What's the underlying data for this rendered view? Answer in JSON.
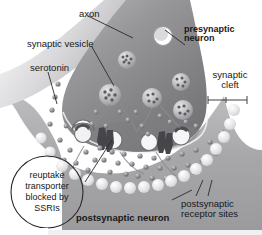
{
  "figure": {
    "background_color": "#ffffff"
  },
  "colors": {
    "presynaptic_fill": "#8e8e91",
    "presynaptic_dark": "#6c6c70",
    "postsynaptic_fill": "#a9a9ad",
    "cleft_fill": "#fdfdfd",
    "receptor_fill": "#e4e4e6",
    "vesicle_fill": "#b9b9bd",
    "serotonin_dot": "#7c7c80",
    "transporter": "#4a4a4e",
    "text": "#17171a",
    "leader_line": "#2a2a2e"
  },
  "labels": {
    "axon": {
      "text": "axon",
      "bold": false
    },
    "presynaptic_neuron": {
      "line1": "presynaptic",
      "line2": "neuron",
      "bold": true
    },
    "synaptic_vesicle": {
      "text": "synaptic vesicle",
      "bold": false
    },
    "serotonin": {
      "text": "serotonin",
      "bold": false
    },
    "synaptic_cleft": {
      "line1": "synaptic",
      "line2": "cleft",
      "bold": false
    },
    "reuptake_callout": {
      "line1": "reuptake",
      "line2": "transporter",
      "line3": "blocked by",
      "line4": "SSRIs",
      "bold": false
    },
    "postsynaptic_neuron": {
      "text": "postsynaptic neuron",
      "bold": true
    },
    "postsynaptic_receptor_sites": {
      "line1": "postsynaptic",
      "line2": "receptor sites",
      "bold": false
    }
  },
  "structures": {
    "presynaptic_terminal": "axon-terminal-bulb",
    "vesicles_count": 6,
    "docked_vesicles_count": 3,
    "release_sites_count": 4,
    "reuptake_transporters_count": 2,
    "receptor_sites_count": 16,
    "serotonin_molecules_count": 54,
    "cleft_arrow": "double-headed"
  }
}
